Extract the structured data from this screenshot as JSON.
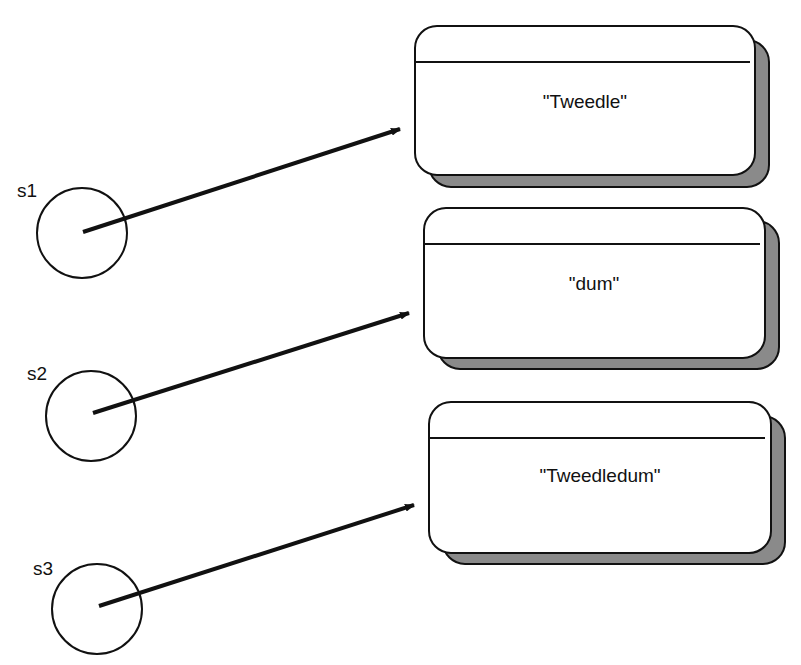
{
  "diagram": {
    "variables": [
      {
        "label": "s1",
        "value": "\"Tweedle\""
      },
      {
        "label": "s2",
        "value": "\"dum\""
      },
      {
        "label": "s3",
        "value": "\"Tweedledum\""
      }
    ],
    "colors": {
      "stroke": "#111111",
      "shadow": "#8a8a8a",
      "background": "#ffffff"
    }
  }
}
